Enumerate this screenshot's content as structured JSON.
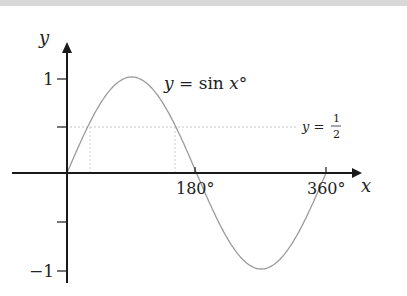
{
  "chart_data": {
    "type": "line",
    "title": "",
    "xlabel": "x",
    "ylabel": "y",
    "x_ticks": [
      "180°",
      "360°"
    ],
    "y_ticks": [
      "1",
      "−1"
    ],
    "xlim": [
      0,
      360
    ],
    "ylim": [
      -1,
      1
    ],
    "grid": false,
    "series": [
      {
        "name": "y = sin x°",
        "x": [
          0,
          30,
          90,
          150,
          180,
          270,
          360
        ],
        "y": [
          0,
          0.5,
          1,
          0.5,
          0,
          -1,
          0
        ]
      }
    ],
    "reference_lines": [
      {
        "type": "horizontal",
        "y": 0.5,
        "label": "y = 1/2",
        "style": "dotted"
      },
      {
        "type": "vertical",
        "x": 30,
        "style": "dotted"
      },
      {
        "type": "vertical",
        "x": 150,
        "style": "dotted"
      }
    ],
    "annotations": [
      "y = sin x°",
      "y = 1/2"
    ]
  },
  "labels": {
    "y_axis": "y",
    "x_axis": "x",
    "y_tick_pos": "1",
    "y_tick_neg": "−1",
    "x_tick_180": "180°",
    "x_tick_360": "360°",
    "curve_label": "y = sin x°",
    "half_line_lhs": "y =",
    "half_num": "1",
    "half_den": "2"
  }
}
